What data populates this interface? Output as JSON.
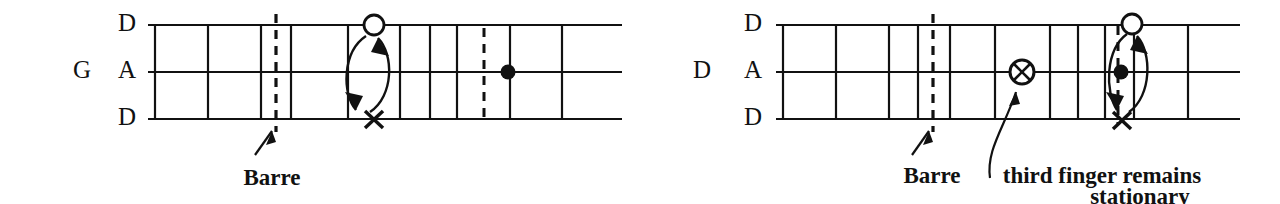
{
  "figure": {
    "ink_color": "#111111",
    "background_color": "#ffffff"
  },
  "diagrams": [
    {
      "id": "left",
      "tuning_label": "G",
      "string_labels": [
        "D",
        "A",
        "D"
      ],
      "fret_count": 9,
      "markers": [
        {
          "symbol": "open-circle",
          "glyph": "O",
          "string": "D-high",
          "fret_index": 4
        },
        {
          "symbol": "x",
          "glyph": "X",
          "string": "D-low",
          "fret_index": 4
        },
        {
          "symbol": "filled-dot",
          "glyph": "●",
          "string": "A",
          "fret_index": 7
        }
      ],
      "barre": {
        "label": "Barre",
        "fret_index": 2
      },
      "slide_line": {
        "fret_index": 7
      },
      "arrow": {
        "type": "double-headed-ellipse",
        "from": "D-high",
        "to": "D-low"
      }
    },
    {
      "id": "right",
      "tuning_label": "D",
      "string_labels": [
        "D",
        "A",
        "D"
      ],
      "fret_count": 10,
      "markers": [
        {
          "symbol": "circled-x",
          "glyph": "⊗",
          "string": "A",
          "fret_index": 5
        },
        {
          "symbol": "open-circle",
          "glyph": "O",
          "string": "D-high",
          "fret_index": 8
        },
        {
          "symbol": "filled-dot",
          "glyph": "●",
          "string": "A",
          "fret_index": 8
        },
        {
          "symbol": "x",
          "glyph": "X",
          "string": "D-low",
          "fret_index": 8
        }
      ],
      "barre": {
        "label": "Barre",
        "fret_index": 3
      },
      "slide_line": {
        "fret_index": 8
      },
      "arrow": {
        "type": "double-headed-ellipse",
        "from": "D-high",
        "to": "D-low"
      },
      "caption": {
        "line1": "third finger remains",
        "line2": "stationary"
      }
    }
  ]
}
